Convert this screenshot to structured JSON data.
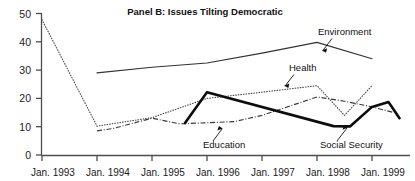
{
  "chart_data": {
    "type": "line",
    "title": "Panel B: Issues Tilting Democratic",
    "xlabel": "",
    "ylabel": "",
    "grid": false,
    "legend_position": "inline-annotations",
    "ylim": [
      0,
      50
    ],
    "yticks": [
      0,
      10,
      20,
      30,
      40,
      50
    ],
    "ytick_labels": [
      "0",
      "10",
      "20",
      "30",
      "40",
      "50"
    ],
    "xtick_labels": [
      "Jan. 1993",
      "Jan. 1994",
      "Jan. 1995",
      "Jan. 1996",
      "Jan. 1997",
      "Jan. 1998",
      "Jan. 1999"
    ],
    "x": [
      1993.0,
      1994.0,
      1995.0,
      1996.0,
      1997.0,
      1998.0,
      1998.5,
      1999.0
    ],
    "series": [
      {
        "name": "Environment",
        "style": "solid-thin",
        "points": [
          {
            "x": 1994.0,
            "y": 29.0
          },
          {
            "x": 1995.0,
            "y": 31.0
          },
          {
            "x": 1996.0,
            "y": 32.5
          },
          {
            "x": 1997.0,
            "y": 36.0
          },
          {
            "x": 1998.0,
            "y": 39.8
          },
          {
            "x": 1999.0,
            "y": 34.0
          }
        ]
      },
      {
        "name": "Health",
        "style": "dotted",
        "points": [
          {
            "x": 1993.0,
            "y": 47.8
          },
          {
            "x": 1994.0,
            "y": 10.2
          },
          {
            "x": 1995.0,
            "y": 13.2
          },
          {
            "x": 1996.0,
            "y": 20.0
          },
          {
            "x": 1997.0,
            "y": 22.2
          },
          {
            "x": 1998.0,
            "y": 24.5
          },
          {
            "x": 1998.5,
            "y": 14.0
          },
          {
            "x": 1999.0,
            "y": 24.5
          }
        ]
      },
      {
        "name": "Education",
        "style": "dash-dot",
        "points": [
          {
            "x": 1994.0,
            "y": 8.5
          },
          {
            "x": 1994.3,
            "y": 9.4
          },
          {
            "x": 1995.0,
            "y": 13.0
          },
          {
            "x": 1995.5,
            "y": 11.0
          },
          {
            "x": 1996.5,
            "y": 11.8
          },
          {
            "x": 1997.0,
            "y": 14.0
          },
          {
            "x": 1998.0,
            "y": 20.5
          },
          {
            "x": 1998.5,
            "y": 19.0
          },
          {
            "x": 1999.0,
            "y": 17.0
          },
          {
            "x": 1999.4,
            "y": 15.0
          }
        ]
      },
      {
        "name": "Social Security",
        "style": "solid-thick",
        "points": [
          {
            "x": 1995.6,
            "y": 11.3
          },
          {
            "x": 1996.0,
            "y": 22.2
          },
          {
            "x": 1998.3,
            "y": 10.2
          },
          {
            "x": 1998.6,
            "y": 10.1
          },
          {
            "x": 1999.0,
            "y": 17.0
          },
          {
            "x": 1999.3,
            "y": 18.7
          },
          {
            "x": 1999.5,
            "y": 13.0
          }
        ]
      }
    ],
    "annotations": [
      {
        "label": "Environment",
        "series": "Environment"
      },
      {
        "label": "Health",
        "series": "Health"
      },
      {
        "label": "Education",
        "series": "Education"
      },
      {
        "label": "Social Security",
        "series": "Social Security"
      }
    ]
  },
  "colors": {
    "background": "#ffffff",
    "axis": "#4d4d4d",
    "text": "#1a1a1a",
    "environment": "#333333",
    "health": "#4a4a4a",
    "education": "#3a3a3a",
    "social_security": "#0d0d0d"
  }
}
